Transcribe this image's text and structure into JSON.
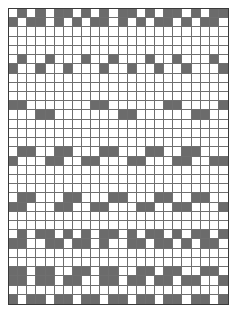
{
  "figure": {
    "name": "grid-pattern",
    "columns": 24,
    "rows": 32,
    "cell_width_px": 9.2,
    "cell_height_px": 9.2,
    "origin_x_px": 8,
    "origin_y_px": 8
  },
  "colors": {
    "page_background": "#ffffff",
    "cell_empty": "#ffffff",
    "cell_filled": "#6b6b6b",
    "gridline": "#6f6f6f",
    "outer_border": "#3a3a3a"
  },
  "chart_data": {
    "type": "heatmap",
    "title": "",
    "subtitle": "",
    "xlabel": "",
    "ylabel": "",
    "legend": [],
    "annotations": [],
    "grid": true,
    "xlim": [
      0,
      24
    ],
    "ylim": [
      0,
      32
    ],
    "categories_x": [
      "1",
      "2",
      "3",
      "4",
      "5",
      "6",
      "7",
      "8",
      "9",
      "10",
      "11",
      "12",
      "13",
      "14",
      "15",
      "16",
      "17",
      "18",
      "19",
      "20",
      "21",
      "22",
      "23",
      "24"
    ],
    "categories_y": [
      "1",
      "2",
      "3",
      "4",
      "5",
      "6",
      "7",
      "8",
      "9",
      "10",
      "11",
      "12",
      "13",
      "14",
      "15",
      "16",
      "17",
      "18",
      "19",
      "20",
      "21",
      "22",
      "23",
      "24",
      "25",
      "26",
      "27",
      "28",
      "29",
      "30",
      "31",
      "32"
    ],
    "value_legend": {
      "0": "empty / white cell",
      "1": "filled / gray cell"
    },
    "matrix": [
      [
        0,
        1,
        0,
        1,
        0,
        1,
        1,
        0,
        1,
        0,
        1,
        0,
        1,
        1,
        0,
        1,
        0,
        1,
        1,
        0,
        1,
        0,
        1,
        1
      ],
      [
        1,
        0,
        1,
        1,
        0,
        1,
        0,
        1,
        0,
        1,
        1,
        0,
        1,
        0,
        1,
        0,
        1,
        1,
        0,
        1,
        0,
        1,
        1,
        0
      ],
      [
        0,
        0,
        0,
        0,
        0,
        0,
        0,
        0,
        0,
        0,
        0,
        0,
        0,
        0,
        0,
        0,
        0,
        0,
        0,
        0,
        0,
        0,
        0,
        0
      ],
      [
        0,
        0,
        0,
        0,
        0,
        0,
        0,
        0,
        0,
        0,
        0,
        0,
        0,
        0,
        0,
        0,
        0,
        0,
        0,
        0,
        0,
        0,
        0,
        0
      ],
      [
        0,
        0,
        0,
        0,
        0,
        0,
        0,
        0,
        0,
        0,
        0,
        0,
        0,
        0,
        0,
        0,
        0,
        0,
        0,
        0,
        0,
        0,
        0,
        0
      ],
      [
        0,
        1,
        0,
        0,
        1,
        0,
        0,
        0,
        1,
        0,
        0,
        1,
        0,
        0,
        0,
        1,
        0,
        0,
        1,
        0,
        0,
        0,
        1,
        0
      ],
      [
        1,
        0,
        0,
        1,
        0,
        0,
        1,
        0,
        0,
        0,
        1,
        0,
        0,
        1,
        0,
        0,
        1,
        0,
        0,
        1,
        0,
        0,
        0,
        1
      ],
      [
        0,
        0,
        0,
        0,
        0,
        0,
        0,
        0,
        0,
        0,
        0,
        0,
        0,
        0,
        0,
        0,
        0,
        0,
        0,
        0,
        0,
        0,
        0,
        0
      ],
      [
        0,
        0,
        0,
        0,
        0,
        0,
        0,
        0,
        0,
        0,
        0,
        0,
        0,
        0,
        0,
        0,
        0,
        0,
        0,
        0,
        0,
        0,
        0,
        0
      ],
      [
        0,
        0,
        0,
        0,
        0,
        0,
        0,
        0,
        0,
        0,
        0,
        0,
        0,
        0,
        0,
        0,
        0,
        0,
        0,
        0,
        0,
        0,
        0,
        0
      ],
      [
        1,
        1,
        0,
        0,
        0,
        0,
        0,
        0,
        0,
        1,
        1,
        0,
        0,
        0,
        0,
        0,
        0,
        1,
        1,
        0,
        0,
        0,
        0,
        1
      ],
      [
        0,
        0,
        0,
        1,
        1,
        0,
        0,
        0,
        0,
        0,
        0,
        0,
        1,
        1,
        0,
        0,
        0,
        0,
        0,
        0,
        1,
        1,
        0,
        0
      ],
      [
        0,
        0,
        0,
        0,
        0,
        0,
        0,
        0,
        0,
        0,
        0,
        0,
        0,
        0,
        0,
        0,
        0,
        0,
        0,
        0,
        0,
        0,
        0,
        0
      ],
      [
        0,
        0,
        0,
        0,
        0,
        0,
        0,
        0,
        0,
        0,
        0,
        0,
        0,
        0,
        0,
        0,
        0,
        0,
        0,
        0,
        0,
        0,
        0,
        0
      ],
      [
        0,
        0,
        0,
        0,
        0,
        0,
        0,
        0,
        0,
        0,
        0,
        0,
        0,
        0,
        0,
        0,
        0,
        0,
        0,
        0,
        0,
        0,
        0,
        0
      ],
      [
        0,
        1,
        1,
        0,
        0,
        1,
        1,
        0,
        0,
        0,
        1,
        1,
        0,
        0,
        0,
        1,
        1,
        0,
        0,
        1,
        1,
        0,
        0,
        0
      ],
      [
        1,
        0,
        0,
        0,
        1,
        1,
        0,
        0,
        1,
        1,
        0,
        0,
        0,
        1,
        1,
        0,
        0,
        0,
        1,
        1,
        0,
        0,
        1,
        1
      ],
      [
        0,
        0,
        0,
        0,
        0,
        0,
        0,
        0,
        0,
        0,
        0,
        0,
        0,
        0,
        0,
        0,
        0,
        0,
        0,
        0,
        0,
        0,
        0,
        0
      ],
      [
        0,
        0,
        0,
        0,
        0,
        0,
        0,
        0,
        0,
        0,
        0,
        0,
        0,
        0,
        0,
        0,
        0,
        0,
        0,
        0,
        0,
        0,
        0,
        0
      ],
      [
        0,
        0,
        0,
        0,
        0,
        0,
        0,
        0,
        0,
        0,
        0,
        0,
        0,
        0,
        0,
        0,
        0,
        0,
        0,
        0,
        0,
        0,
        0,
        0
      ],
      [
        0,
        1,
        1,
        0,
        0,
        0,
        1,
        1,
        0,
        0,
        0,
        1,
        1,
        0,
        0,
        0,
        1,
        1,
        0,
        0,
        1,
        1,
        0,
        0
      ],
      [
        1,
        1,
        0,
        0,
        0,
        1,
        1,
        0,
        0,
        1,
        1,
        0,
        0,
        0,
        1,
        1,
        0,
        0,
        1,
        1,
        0,
        0,
        0,
        1
      ],
      [
        0,
        0,
        0,
        0,
        0,
        0,
        0,
        0,
        0,
        0,
        0,
        0,
        0,
        0,
        0,
        0,
        0,
        0,
        0,
        0,
        0,
        0,
        0,
        0
      ],
      [
        0,
        0,
        0,
        0,
        0,
        0,
        0,
        0,
        0,
        0,
        0,
        0,
        0,
        0,
        0,
        0,
        0,
        0,
        0,
        0,
        0,
        0,
        0,
        0
      ],
      [
        0,
        1,
        0,
        1,
        1,
        0,
        1,
        0,
        1,
        0,
        1,
        1,
        0,
        1,
        0,
        1,
        1,
        0,
        1,
        0,
        1,
        1,
        0,
        1
      ],
      [
        1,
        1,
        0,
        0,
        1,
        1,
        0,
        1,
        1,
        0,
        1,
        0,
        0,
        1,
        1,
        0,
        1,
        1,
        0,
        1,
        0,
        1,
        1,
        0
      ],
      [
        0,
        0,
        0,
        0,
        0,
        0,
        0,
        0,
        0,
        0,
        0,
        0,
        0,
        0,
        0,
        0,
        0,
        0,
        0,
        0,
        0,
        0,
        0,
        0
      ],
      [
        0,
        0,
        0,
        0,
        0,
        0,
        0,
        0,
        0,
        0,
        0,
        0,
        0,
        0,
        0,
        0,
        0,
        0,
        0,
        0,
        0,
        0,
        0,
        0
      ],
      [
        1,
        1,
        0,
        1,
        1,
        0,
        0,
        1,
        1,
        0,
        1,
        1,
        0,
        0,
        1,
        1,
        0,
        1,
        1,
        0,
        0,
        1,
        1,
        0
      ],
      [
        1,
        1,
        0,
        1,
        1,
        0,
        1,
        1,
        0,
        0,
        1,
        1,
        0,
        1,
        1,
        0,
        1,
        1,
        0,
        1,
        1,
        0,
        0,
        1
      ],
      [
        0,
        0,
        0,
        0,
        0,
        0,
        0,
        0,
        0,
        0,
        0,
        0,
        0,
        0,
        0,
        0,
        0,
        0,
        0,
        0,
        0,
        0,
        0,
        0
      ],
      [
        1,
        0,
        1,
        1,
        0,
        1,
        1,
        0,
        1,
        1,
        0,
        1,
        1,
        0,
        1,
        1,
        0,
        1,
        1,
        0,
        1,
        1,
        0,
        1
      ]
    ]
  }
}
